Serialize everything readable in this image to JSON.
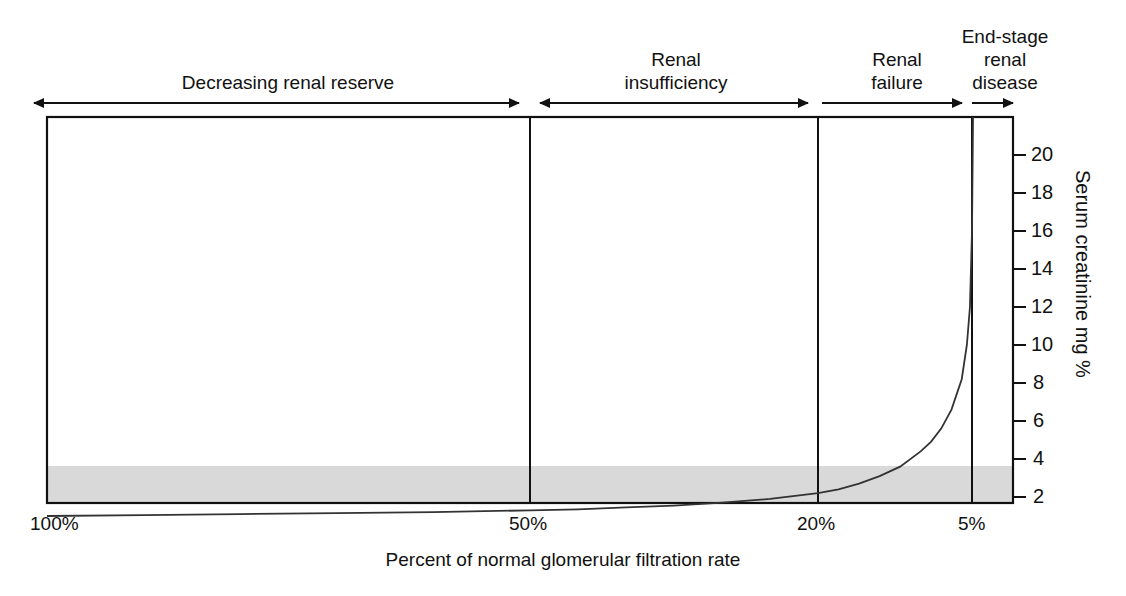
{
  "figure": {
    "background": "#ffffff",
    "line_color": "#1a1a1a",
    "band_color": "#d9d9d9"
  },
  "stages": [
    {
      "name": "decreasing-renal-reserve",
      "label": "Decreasing renal reserve"
    },
    {
      "name": "renal-insufficiency",
      "label": "Renal\ninsufficiency"
    },
    {
      "name": "renal-failure",
      "label": "Renal\nfailure"
    },
    {
      "name": "end-stage-renal-disease",
      "label": "End-stage\nrenal\ndisease"
    }
  ],
  "chart_data": {
    "type": "line",
    "title": "",
    "xlabel": "Percent of normal glomerular filtration rate",
    "ylabel": "Serum creatinine mg %",
    "x_tick_labels": [
      "100%",
      "50%",
      "20%",
      "5%"
    ],
    "x_tick_values": [
      100,
      50,
      20,
      5
    ],
    "y_tick_labels": [
      "2",
      "4",
      "6",
      "8",
      "10",
      "12",
      "14",
      "16",
      "18",
      "20"
    ],
    "y_tick_values": [
      2,
      4,
      6,
      8,
      10,
      12,
      14,
      16,
      18,
      20
    ],
    "ylim": [
      0,
      22
    ],
    "grid": false,
    "legend": "none",
    "normal_range_band": {
      "label": "",
      "y_from": 0.0,
      "y_to": 2.0
    },
    "stage_boundaries_percent": [
      50,
      20,
      5
    ],
    "series": [
      {
        "name": "Serum creatinine vs GFR",
        "x": [
          100,
          90,
          80,
          70,
          60,
          50,
          45,
          40,
          35,
          30,
          25,
          20,
          18,
          16,
          14,
          12,
          10,
          9,
          8,
          7,
          6,
          5.5,
          5.2,
          5.0,
          4.9
        ],
        "values": [
          1.0,
          1.05,
          1.1,
          1.15,
          1.2,
          1.3,
          1.35,
          1.45,
          1.55,
          1.7,
          1.9,
          2.2,
          2.4,
          2.7,
          3.1,
          3.6,
          4.4,
          4.9,
          5.6,
          6.6,
          8.2,
          10.0,
          12.0,
          16.0,
          22.0
        ]
      }
    ]
  }
}
